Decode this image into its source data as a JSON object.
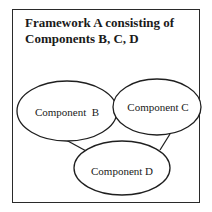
{
  "title": {
    "line1": "Framework A consisting of",
    "line2": "Components B, C, D"
  },
  "nodes": [
    {
      "id": "B",
      "label": "Component  B",
      "cx": 67,
      "cy": 111,
      "rx": 50,
      "ry": 30
    },
    {
      "id": "C",
      "label": "Component C",
      "cx": 157,
      "cy": 107,
      "rx": 44,
      "ry": 28
    },
    {
      "id": "D",
      "label": "Component D",
      "cx": 122,
      "cy": 168,
      "rx": 48,
      "ry": 27
    }
  ],
  "edges": [
    {
      "from": "B",
      "to": "D"
    },
    {
      "from": "C",
      "to": "D"
    }
  ],
  "colors": {
    "stroke": "#1f1f1f",
    "text": "#1a1a1a",
    "background": "#ffffff"
  }
}
